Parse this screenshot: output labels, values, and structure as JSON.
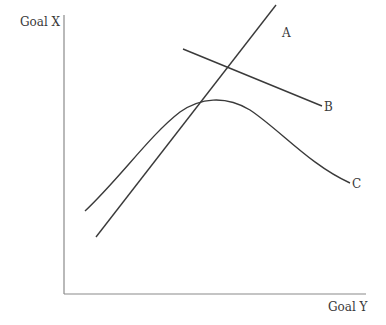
{
  "diagram": {
    "y_axis_label": "Goal X",
    "x_axis_label": "Goal Y",
    "lines": [
      {
        "id": "A",
        "label": "A",
        "type": "straight",
        "from": [
          96,
          237
        ],
        "to": [
          276,
          5
        ]
      },
      {
        "id": "B",
        "label": "B",
        "type": "straight",
        "from": [
          183,
          49
        ],
        "to": [
          322,
          106
        ]
      },
      {
        "id": "C",
        "label": "C",
        "type": "curve",
        "shape": "inverted-u",
        "start": [
          85,
          211
        ],
        "peak": [
          217,
          99
        ],
        "end": [
          350,
          183
        ]
      }
    ],
    "colors": {
      "line": "#3a3a3a",
      "axis": "#8a8a8a",
      "text": "#3a3a3a"
    }
  }
}
